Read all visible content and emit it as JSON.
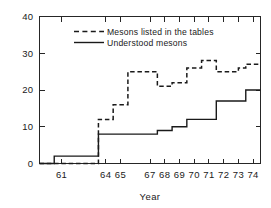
{
  "chart_data": {
    "type": "line",
    "title": "",
    "subtitle": "",
    "xlabel": "Year",
    "ylabel": "",
    "xlim": [
      59.5,
      74.5
    ],
    "ylim": [
      0,
      40
    ],
    "grid": false,
    "legend_position": "upper-center",
    "step_style": "post",
    "x_tick_labels": [
      "61",
      "64",
      "65",
      "67",
      "68",
      "69",
      "70",
      "71",
      "72",
      "73",
      "74"
    ],
    "x_tick_values": [
      61,
      64,
      65,
      67,
      68,
      69,
      70,
      71,
      72,
      73,
      74
    ],
    "y_tick_labels": [
      "0",
      "10",
      "20",
      "30",
      "40"
    ],
    "y_tick_values": [
      0,
      10,
      20,
      30,
      40
    ],
    "series": [
      {
        "name": "Mesons listed in the tables",
        "style": "dashed",
        "color": "#1a1a1a",
        "x": [
          59.5,
          63.5,
          64.5,
          65.5,
          67.5,
          68.5,
          69.5,
          70.5,
          71.5,
          73.0,
          73.5,
          74.5
        ],
        "values": [
          0,
          12,
          16,
          25,
          21,
          22,
          26,
          28,
          25,
          26,
          27,
          27
        ]
      },
      {
        "name": "Understood mesons",
        "style": "solid",
        "color": "#1a1a1a",
        "x": [
          59.5,
          60.5,
          63.5,
          67.5,
          68.5,
          69.5,
          71.5,
          73.5,
          74.5
        ],
        "values": [
          0,
          2,
          8,
          9,
          10,
          12,
          17,
          20,
          20
        ]
      }
    ]
  },
  "legend": {
    "entries": [
      {
        "label": "Mesons listed in the tables",
        "style": "dashed"
      },
      {
        "label": "Understood mesons",
        "style": "solid"
      }
    ]
  },
  "axes": {
    "x_title": "Year",
    "y_title": ""
  }
}
